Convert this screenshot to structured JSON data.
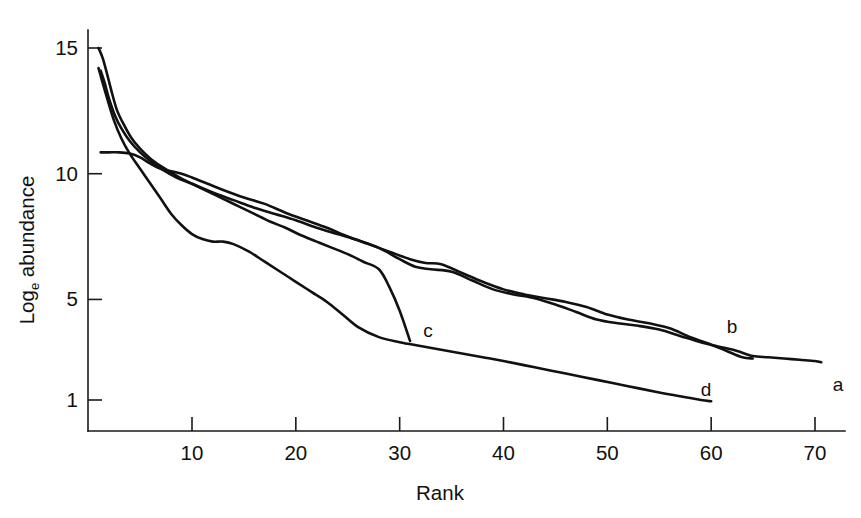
{
  "chart_data": {
    "type": "line",
    "title": "",
    "xlabel": "Rank",
    "ylabel": "Log_e abundance",
    "ylabel_base": "Log",
    "ylabel_sub": "e",
    "ylabel_rest": " abundance",
    "grid": false,
    "legend_position": "inline-end-labels",
    "xlim": [
      0,
      74
    ],
    "ylim": [
      0,
      15.6
    ],
    "xticks": [
      10,
      20,
      30,
      40,
      50,
      60,
      70
    ],
    "xtick_labels": [
      "10",
      "20",
      "30",
      "40",
      "50",
      "60",
      "70"
    ],
    "yticks": [
      1,
      5,
      10,
      15
    ],
    "ytick_labels": [
      "1",
      "5",
      "10",
      "15"
    ],
    "series": [
      {
        "name": "a",
        "label": "a",
        "x": [
          1.2,
          1.6,
          2.0,
          2.6,
          3.2,
          4.0,
          5.0,
          6.0,
          7.0,
          8.5,
          10.0,
          12.0,
          14.0,
          16.0,
          18.0,
          20.0,
          22.0,
          24.0,
          26.0,
          28.0,
          30.0,
          31.5,
          33.0,
          35.0,
          37.0,
          39.0,
          41.0,
          43.0,
          45.0,
          47.0,
          49.0,
          51.0,
          53.0,
          55.0,
          57.0,
          59.0,
          61.0,
          62.5,
          64.0,
          65.5,
          67.0,
          68.5,
          70.0,
          70.6
        ],
        "y": [
          14.1,
          13.6,
          13.0,
          12.3,
          11.8,
          11.3,
          10.85,
          10.5,
          10.2,
          9.85,
          9.6,
          9.25,
          8.95,
          8.65,
          8.4,
          8.15,
          7.85,
          7.6,
          7.35,
          7.05,
          6.6,
          6.3,
          6.2,
          6.1,
          5.75,
          5.4,
          5.2,
          5.05,
          4.8,
          4.5,
          4.2,
          4.05,
          3.95,
          3.8,
          3.55,
          3.3,
          3.1,
          2.95,
          2.75,
          2.7,
          2.65,
          2.6,
          2.55,
          2.5
        ]
      },
      {
        "name": "b",
        "label": "b",
        "x": [
          1.2,
          2.0,
          3.0,
          4.0,
          5.0,
          6.0,
          7.0,
          8.0,
          9.0,
          10.0,
          11.5,
          13.0,
          15.0,
          17.0,
          19.0,
          21.0,
          23.0,
          25.0,
          27.0,
          29.0,
          31.0,
          32.5,
          34.0,
          36.0,
          38.0,
          40.0,
          42.0,
          44.0,
          46.0,
          48.0,
          50.0,
          52.0,
          54.0,
          56.0,
          58.0,
          60.0,
          61.5,
          63.0,
          64.0
        ],
        "y": [
          10.85,
          10.85,
          10.85,
          10.8,
          10.65,
          10.4,
          10.2,
          10.1,
          10.0,
          9.85,
          9.6,
          9.35,
          9.05,
          8.8,
          8.45,
          8.15,
          7.85,
          7.5,
          7.2,
          6.9,
          6.6,
          6.45,
          6.4,
          6.05,
          5.7,
          5.4,
          5.2,
          5.05,
          4.9,
          4.7,
          4.4,
          4.2,
          4.05,
          3.85,
          3.5,
          3.2,
          2.95,
          2.7,
          2.65
        ]
      },
      {
        "name": "c",
        "label": "c",
        "x": [
          1.0,
          1.4,
          1.8,
          2.3,
          2.8,
          3.5,
          4.2,
          5.0,
          6.0,
          7.0,
          8.0,
          9.0,
          10.0,
          11.0,
          12.0,
          13.0,
          14.5,
          16.0,
          17.5,
          19.0,
          20.5,
          22.0,
          23.5,
          25.0,
          26.5,
          28.0,
          29.0,
          30.0,
          31.0
        ],
        "y": [
          15.0,
          14.6,
          14.0,
          13.2,
          12.5,
          11.9,
          11.4,
          11.0,
          10.6,
          10.3,
          10.05,
          9.8,
          9.6,
          9.4,
          9.2,
          9.0,
          8.7,
          8.4,
          8.1,
          7.85,
          7.55,
          7.3,
          7.05,
          6.8,
          6.5,
          6.2,
          5.5,
          4.55,
          3.35
        ]
      },
      {
        "name": "d",
        "label": "d",
        "x": [
          1.0,
          1.4,
          1.9,
          2.5,
          3.2,
          4.0,
          5.0,
          6.0,
          7.0,
          8.0,
          9.0,
          10.0,
          11.0,
          12.0,
          13.0,
          14.0,
          15.5,
          17.0,
          18.5,
          20.0,
          21.5,
          23.0,
          24.5,
          26.0,
          28.0,
          30.0,
          32.0,
          34.0,
          36.0,
          38.0,
          40.0,
          43.0,
          46.0,
          49.0,
          52.0,
          55.0,
          57.0,
          59.0,
          60.0
        ],
        "y": [
          14.2,
          13.6,
          12.9,
          12.1,
          11.4,
          10.8,
          10.2,
          9.6,
          9.0,
          8.4,
          7.95,
          7.6,
          7.4,
          7.3,
          7.3,
          7.2,
          6.9,
          6.5,
          6.1,
          5.7,
          5.3,
          4.9,
          4.4,
          3.9,
          3.5,
          3.3,
          3.15,
          3.0,
          2.85,
          2.7,
          2.55,
          2.3,
          2.05,
          1.8,
          1.55,
          1.3,
          1.15,
          1.0,
          0.95
        ]
      }
    ],
    "series_end_labels": [
      {
        "name": "a",
        "label": "a",
        "x_px": 838,
        "y_px": 391
      },
      {
        "name": "b",
        "label": "b",
        "x_px": 732,
        "y_px": 333
      },
      {
        "name": "c",
        "label": "c",
        "x_px": 428,
        "y_px": 337
      },
      {
        "name": "d",
        "label": "d",
        "x_px": 706,
        "y_px": 396
      }
    ],
    "colors": {
      "curve": "#111111",
      "axis": "#1a1a1a",
      "background": "#ffffff",
      "text": "#111111"
    }
  }
}
